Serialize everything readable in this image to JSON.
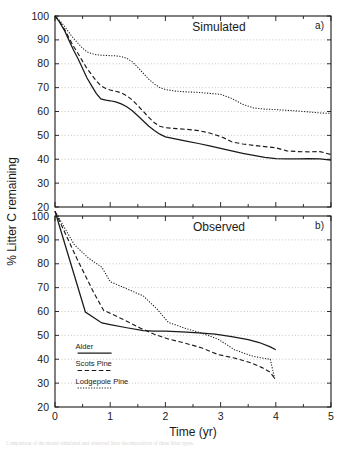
{
  "figure": {
    "axis_y_label": "% Litter C remaining",
    "axis_x_label": "Time (yr)",
    "caption": "Comparison of the model simulated and observed litter decomposition of three litter types."
  },
  "legend": {
    "items": [
      {
        "label": "Alder",
        "style": "solid"
      },
      {
        "label": "Scots Pine",
        "style": "dashed"
      },
      {
        "label": "Lodgepole Pine",
        "style": "dotted"
      }
    ]
  },
  "chart_data": [
    {
      "type": "line",
      "title": "Simulated",
      "panel_label": "a)",
      "xlabel": "",
      "ylabel": "% Litter C remaining",
      "xlim": [
        0,
        5
      ],
      "ylim": [
        20,
        100
      ],
      "xticks": [
        0,
        1,
        2,
        3,
        4,
        5
      ],
      "yticks": [
        20,
        30,
        40,
        50,
        60,
        70,
        80,
        90,
        100
      ],
      "grid": true,
      "legend_position": "none",
      "series": [
        {
          "name": "Alder",
          "style": "solid",
          "x": [
            0.0,
            0.08,
            0.17,
            0.25,
            0.33,
            0.42,
            0.5,
            0.58,
            0.67,
            0.75,
            0.83,
            0.92,
            1.0,
            1.1,
            1.2,
            1.3,
            1.4,
            1.5,
            1.6,
            1.7,
            1.8,
            1.9,
            2.0,
            2.2,
            2.4,
            2.6,
            2.8,
            3.0,
            3.2,
            3.4,
            3.6,
            3.8,
            4.0,
            4.2,
            4.4,
            4.6,
            4.8,
            5.0
          ],
          "y": [
            100.0,
            97.5,
            94.0,
            90.0,
            86.0,
            82.0,
            78.0,
            74.0,
            70.5,
            67.5,
            65.3,
            64.8,
            64.5,
            64.0,
            63.2,
            62.0,
            60.3,
            58.2,
            56.0,
            53.8,
            52.0,
            50.5,
            49.4,
            48.4,
            47.5,
            46.6,
            45.6,
            44.6,
            43.5,
            42.5,
            41.6,
            40.8,
            40.3,
            40.2,
            40.2,
            40.3,
            40.2,
            39.6
          ]
        },
        {
          "name": "Scots Pine",
          "style": "dashed",
          "x": [
            0.0,
            0.08,
            0.17,
            0.25,
            0.33,
            0.42,
            0.5,
            0.58,
            0.67,
            0.75,
            0.83,
            0.92,
            1.0,
            1.1,
            1.2,
            1.3,
            1.4,
            1.5,
            1.6,
            1.7,
            1.8,
            1.9,
            2.0,
            2.2,
            2.4,
            2.6,
            2.8,
            3.0,
            3.1,
            3.2,
            3.4,
            3.6,
            3.8,
            4.0,
            4.2,
            4.4,
            4.6,
            4.8,
            5.0
          ],
          "y": [
            100.0,
            97.8,
            94.5,
            91.0,
            87.5,
            84.2,
            81.0,
            78.0,
            75.2,
            72.8,
            70.8,
            69.6,
            69.0,
            68.5,
            67.8,
            66.6,
            64.8,
            62.5,
            60.0,
            57.5,
            55.3,
            53.8,
            53.2,
            52.8,
            52.5,
            52.0,
            51.0,
            49.5,
            48.5,
            47.3,
            46.4,
            45.8,
            45.3,
            44.8,
            43.5,
            43.2,
            43.1,
            43.2,
            42.0
          ]
        },
        {
          "name": "Lodgepole Pine",
          "style": "dotted",
          "x": [
            0.0,
            0.08,
            0.17,
            0.25,
            0.33,
            0.42,
            0.5,
            0.58,
            0.67,
            0.75,
            0.83,
            0.92,
            1.0,
            1.1,
            1.2,
            1.3,
            1.4,
            1.5,
            1.6,
            1.7,
            1.8,
            1.9,
            2.0,
            2.2,
            2.4,
            2.6,
            2.8,
            3.0,
            3.2,
            3.4,
            3.6,
            3.8,
            4.0,
            4.2,
            4.4,
            4.6,
            4.8,
            5.0
          ],
          "y": [
            100.0,
            98.2,
            95.8,
            93.2,
            90.8,
            88.5,
            86.5,
            85.0,
            84.2,
            83.8,
            83.6,
            83.5,
            83.4,
            83.3,
            83.0,
            82.3,
            80.8,
            78.5,
            76.0,
            73.5,
            71.5,
            70.0,
            69.2,
            68.5,
            68.2,
            68.0,
            67.6,
            67.2,
            65.5,
            63.0,
            61.5,
            61.0,
            60.8,
            60.5,
            60.2,
            59.8,
            59.4,
            59.2
          ]
        }
      ]
    },
    {
      "type": "line",
      "title": "Observed",
      "panel_label": "b)",
      "xlabel": "Time (yr)",
      "ylabel": "% Litter C remaining",
      "xlim": [
        0,
        5
      ],
      "ylim": [
        20,
        100
      ],
      "xticks": [
        0,
        1,
        2,
        3,
        4,
        5
      ],
      "yticks": [
        20,
        30,
        40,
        50,
        60,
        70,
        80,
        90,
        100
      ],
      "grid": true,
      "legend_position": "lower-left",
      "series": [
        {
          "name": "Alder",
          "style": "solid",
          "x": [
            0.0,
            0.55,
            0.85,
            1.0,
            1.3,
            1.6,
            1.8,
            2.0,
            2.3,
            2.6,
            2.9,
            3.2,
            3.5,
            3.7,
            3.9,
            4.0
          ],
          "y": [
            102.0,
            59.8,
            55.2,
            54.5,
            53.2,
            52.0,
            51.8,
            51.8,
            51.5,
            51.0,
            50.5,
            49.5,
            48.2,
            47.0,
            45.2,
            44.0
          ]
        },
        {
          "name": "Scots Pine",
          "style": "dashed",
          "x": [
            0.0,
            0.4,
            0.7,
            0.88,
            0.95,
            1.25,
            1.55,
            1.8,
            2.05,
            2.35,
            2.65,
            2.95,
            3.25,
            3.55,
            3.75,
            3.9,
            3.98
          ],
          "y": [
            102.0,
            82.0,
            68.0,
            60.5,
            59.8,
            56.5,
            53.0,
            50.5,
            48.5,
            46.8,
            44.8,
            42.0,
            40.5,
            38.5,
            36.5,
            34.5,
            32.0
          ]
        },
        {
          "name": "Lodgepole Pine",
          "style": "dotted",
          "x": [
            0.0,
            0.35,
            0.6,
            0.85,
            1.0,
            1.3,
            1.6,
            1.85,
            2.05,
            2.35,
            2.65,
            2.95,
            3.25,
            3.55,
            3.75,
            3.9,
            3.98
          ],
          "y": [
            102.0,
            88.0,
            82.5,
            78.5,
            72.5,
            69.5,
            66.5,
            61.0,
            55.5,
            53.0,
            51.0,
            48.5,
            44.0,
            41.5,
            40.5,
            40.0,
            31.8
          ]
        }
      ]
    }
  ]
}
